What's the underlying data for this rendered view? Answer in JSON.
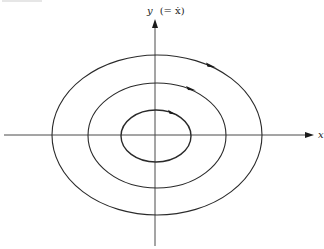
{
  "diagram": {
    "x_axis_label": "x",
    "y_axis_label_var": "y",
    "y_axis_label_rest": "(= ẋ)",
    "orbits": [
      {
        "name": "inner-orbit",
        "direction": "clockwise"
      },
      {
        "name": "middle-orbit",
        "direction": "clockwise"
      },
      {
        "name": "outer-orbit",
        "direction": "clockwise"
      }
    ],
    "colors": {
      "line": "#2a2a2a",
      "axis": "#4a4a4a",
      "background": "#ffffff"
    }
  }
}
